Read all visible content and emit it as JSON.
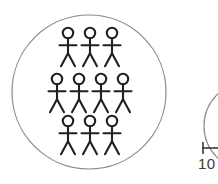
{
  "diagram": {
    "background_color": "#ffffff",
    "stroke_color": "#231f20",
    "circle_stroke_color": "#8a8a8a",
    "main_group": {
      "name": "group-of-ten",
      "shape": "circle",
      "center_x": 89,
      "center_y": 92,
      "radius": 77,
      "stroke_width": 1.2,
      "total_people": 10,
      "rows": [
        {
          "row_index": 1,
          "count": 3,
          "head_y": 33,
          "people": [
            {
              "label": "person-1",
              "head_x": 68
            },
            {
              "label": "person-2",
              "head_x": 90
            },
            {
              "label": "person-3",
              "head_x": 112
            }
          ]
        },
        {
          "row_index": 2,
          "count": 4,
          "head_y": 79,
          "people": [
            {
              "label": "person-4",
              "head_x": 57
            },
            {
              "label": "person-5",
              "head_x": 79
            },
            {
              "label": "person-6",
              "head_x": 101
            },
            {
              "label": "person-7",
              "head_x": 123
            }
          ]
        },
        {
          "row_index": 3,
          "count": 3,
          "head_y": 121,
          "people": [
            {
              "label": "person-8",
              "head_x": 68
            },
            {
              "label": "person-9",
              "head_x": 90
            },
            {
              "label": "person-10",
              "head_x": 112
            }
          ]
        }
      ]
    },
    "person_glyph": {
      "name": "stick-figure",
      "head_radius": 5.2,
      "body_length": 15,
      "arm_half_width": 8.5,
      "arm_offset_from_head": 7,
      "leg_length": 13,
      "leg_spread": 7,
      "stroke_width": 2.1
    },
    "partial_group": {
      "name": "adjacent-group-cutoff",
      "shape": "circle-arc",
      "center_x": 248,
      "center_y": 126,
      "radius": 44,
      "stroke_width": 1.2,
      "label": "10",
      "label_prefix_mark": "⊢"
    }
  }
}
